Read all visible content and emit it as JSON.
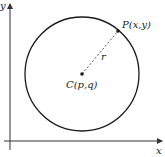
{
  "diagram": {
    "type": "circle-coordinate-geometry",
    "axes": {
      "x_label": "x",
      "y_label": "y"
    },
    "circle": {
      "center_label": "C(p,q)",
      "point_label": "P(x,y)",
      "radius_label": "r"
    },
    "colors": {
      "stroke": "#1a1a1a",
      "axis": "#333333",
      "radius_dash": "#555555",
      "background": "#ffffff"
    }
  }
}
